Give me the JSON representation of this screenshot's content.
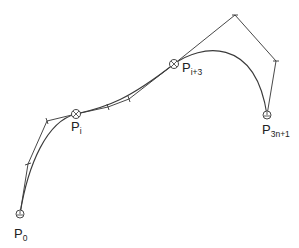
{
  "diagram": {
    "type": "bezier-spline-control-polygon",
    "colors": {
      "line": "#333333",
      "background": "#ffffff"
    },
    "labels": {
      "p0": {
        "base": "P",
        "sub": "0"
      },
      "pi": {
        "base": "P",
        "sub": "i"
      },
      "pi3": {
        "base": "P",
        "sub": "i+3"
      },
      "p3n1": {
        "base": "P",
        "sub": "3n+1"
      }
    },
    "knots": [
      {
        "name": "P0",
        "x": 20,
        "y": 214
      },
      {
        "name": "Pi",
        "x": 76,
        "y": 114
      },
      {
        "name": "Pi+3",
        "x": 174,
        "y": 64
      },
      {
        "name": "P3n+1",
        "x": 267,
        "y": 115
      }
    ],
    "control_polygon": [
      [
        20,
        214
      ],
      [
        28,
        164
      ],
      [
        47,
        121
      ],
      [
        76,
        114
      ],
      [
        108,
        107
      ],
      [
        129,
        99
      ],
      [
        174,
        64
      ],
      [
        235,
        15
      ],
      [
        276,
        61
      ],
      [
        267,
        115
      ]
    ]
  }
}
